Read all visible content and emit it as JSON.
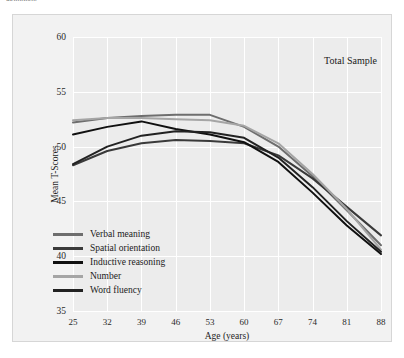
{
  "top_cutoff_text": "definition.",
  "annotation": "Total Sample",
  "axes": {
    "ylabel": "Mean T-Scores",
    "xlabel": "Age (years)",
    "yticks": [
      "35",
      "40",
      "45",
      "50",
      "55",
      "60"
    ],
    "xticks": [
      "25",
      "32",
      "39",
      "46",
      "53",
      "60",
      "67",
      "74",
      "81",
      "88"
    ]
  },
  "legend": {
    "items": [
      {
        "label": "Verbal meaning",
        "color": "#6e6e6e"
      },
      {
        "label": "Spatial orientation",
        "color": "#3a3a3a"
      },
      {
        "label": "Inductive reasoning",
        "color": "#101010"
      },
      {
        "label": "Number",
        "color": "#a5a5a5"
      },
      {
        "label": "Word fluency",
        "color": "#222222"
      }
    ]
  },
  "chart_data": {
    "type": "line",
    "title": "Total Sample",
    "xlabel": "Age (years)",
    "ylabel": "Mean T-Scores",
    "x": [
      25,
      32,
      39,
      46,
      53,
      60,
      67,
      74,
      81,
      88
    ],
    "xlim": [
      25,
      88
    ],
    "ylim": [
      35,
      60
    ],
    "grid": true,
    "legend_position": "inside-lower-left",
    "series": [
      {
        "name": "Verbal meaning",
        "color": "#6e6e6e",
        "values": [
          52.2,
          52.6,
          52.8,
          52.9,
          52.9,
          51.8,
          50.0,
          47.3,
          44.2,
          41.0
        ]
      },
      {
        "name": "Spatial orientation",
        "color": "#3a3a3a",
        "values": [
          48.3,
          49.6,
          50.3,
          50.6,
          50.5,
          50.3,
          49.2,
          47.1,
          44.5,
          41.9
        ]
      },
      {
        "name": "Inductive reasoning",
        "color": "#101010",
        "values": [
          51.1,
          51.8,
          52.3,
          51.6,
          51.1,
          50.4,
          48.6,
          45.8,
          42.8,
          40.2
        ]
      },
      {
        "name": "Number",
        "color": "#a5a5a5",
        "values": [
          52.4,
          52.6,
          52.6,
          52.5,
          52.4,
          51.9,
          50.3,
          47.5,
          44.3,
          40.6
        ]
      },
      {
        "name": "Word fluency",
        "color": "#222222",
        "values": [
          48.4,
          50.0,
          51.0,
          51.4,
          51.3,
          50.8,
          49.0,
          46.3,
          43.2,
          40.4
        ]
      }
    ]
  }
}
